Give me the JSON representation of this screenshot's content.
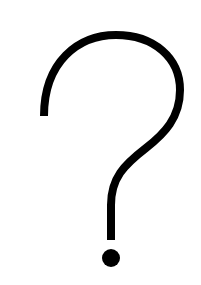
{
  "image": {
    "label": "?",
    "description": "question mark symbol",
    "icon": "question-mark-icon",
    "colors": {
      "background": "#ffffff",
      "foreground": "#000000"
    }
  }
}
